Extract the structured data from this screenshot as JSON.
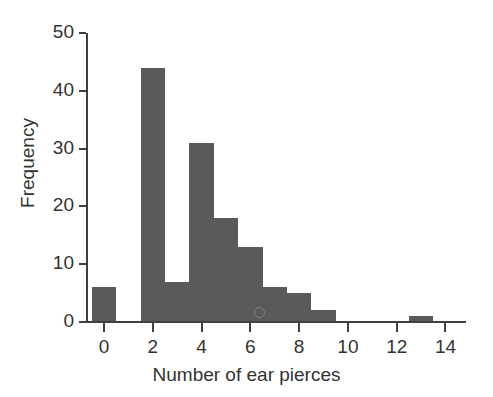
{
  "chart_data": {
    "type": "bar",
    "title": "",
    "subtitle": "",
    "xlabel": "Number of ear pierces",
    "ylabel": "Frequency",
    "categories": [
      0,
      1,
      2,
      3,
      4,
      5,
      6,
      7,
      8,
      9,
      10,
      11,
      12,
      13
    ],
    "values": [
      6,
      0,
      44,
      7,
      31,
      18,
      13,
      6,
      5,
      2,
      0,
      0,
      0,
      1
    ],
    "bar_width": 1,
    "bar_color": "#5a5a5a",
    "xlim": [
      -0.7,
      14.8
    ],
    "ylim": [
      0,
      50
    ],
    "xticks": [
      0,
      2,
      4,
      6,
      8,
      10,
      12,
      14
    ],
    "xtick_labels": [
      "0",
      "2",
      "4",
      "6",
      "8",
      "10",
      "12",
      "14"
    ],
    "yticks": [
      0,
      10,
      20,
      30,
      40,
      50
    ],
    "ytick_labels": [
      "0",
      "10",
      "20",
      "30",
      "40",
      "50"
    ],
    "grid": false,
    "legend": null,
    "annotations": []
  }
}
